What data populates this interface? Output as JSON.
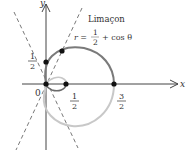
{
  "figure": {
    "title": "Limaçon",
    "equation": {
      "lhs": "r =",
      "frac_num": "1",
      "frac_den": "2",
      "rhs": "+ cos θ"
    },
    "axes": {
      "x_label": "x",
      "y_label": "y",
      "origin_label": "0"
    },
    "tick_labels": {
      "x_half": {
        "num": "1",
        "den": "2"
      },
      "x_three_halves": {
        "num": "3",
        "den": "2"
      },
      "y_half": {
        "num": "1",
        "den": "2"
      }
    },
    "colors": {
      "outer_loop_upper": "#7a7a7a",
      "outer_loop_lower": "#c8c8c8",
      "inner_loop": "#6a6a6a",
      "axes": "#444444",
      "points": "#111111"
    }
  }
}
